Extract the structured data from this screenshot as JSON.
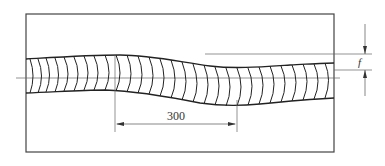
{
  "diagram": {
    "type": "weld-bead-waviness",
    "dimension_pitch": {
      "label": "300"
    },
    "dimension_deviation": {
      "label": "f"
    },
    "colors": {
      "line": "#2a2a2a",
      "thin": "#555555",
      "background": "#ffffff"
    }
  }
}
